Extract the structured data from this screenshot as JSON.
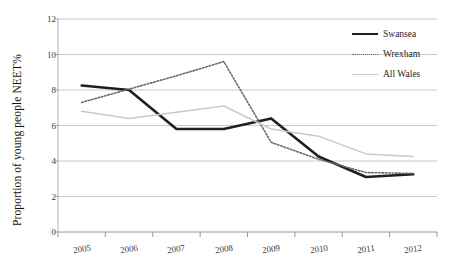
{
  "chart_data": {
    "type": "line",
    "title": "",
    "xlabel": "",
    "ylabel": "Proportion of young people NEET%",
    "categories": [
      "2005",
      "2006",
      "2007",
      "2008",
      "2009",
      "2010",
      "2011",
      "2012"
    ],
    "ylim": [
      0,
      12
    ],
    "yticks": [
      0,
      2,
      4,
      6,
      8,
      10,
      12
    ],
    "ytick_labels": [
      "0",
      "2",
      "4",
      "6",
      "8",
      "10",
      "12"
    ],
    "grid": "horizontal",
    "legend_position": "top-right",
    "series": [
      {
        "name": "Swansea",
        "style": "solid",
        "color": "#1f1f1f",
        "width": 2.6,
        "values": [
          8.25,
          8.0,
          5.8,
          5.8,
          6.4,
          4.25,
          3.1,
          3.25
        ]
      },
      {
        "name": "Wrexham",
        "style": "dotted",
        "color": "#6b6b6b",
        "width": 1.6,
        "values": [
          7.3,
          8.05,
          8.8,
          9.6,
          5.05,
          4.1,
          3.35,
          3.3
        ]
      },
      {
        "name": "All Wales",
        "style": "solid",
        "color": "#c9c9c9",
        "width": 1.5,
        "values": [
          6.8,
          6.4,
          6.75,
          7.1,
          5.8,
          5.4,
          4.4,
          4.25
        ]
      }
    ]
  },
  "legend": {
    "items": [
      {
        "label": "Swansea",
        "swatch": "solid-dark"
      },
      {
        "label": "Wrexham",
        "swatch": "dotted"
      },
      {
        "label": "All Wales",
        "swatch": "solid-light"
      }
    ]
  },
  "axis": {
    "y_title": "Proportion of young people NEET%"
  }
}
